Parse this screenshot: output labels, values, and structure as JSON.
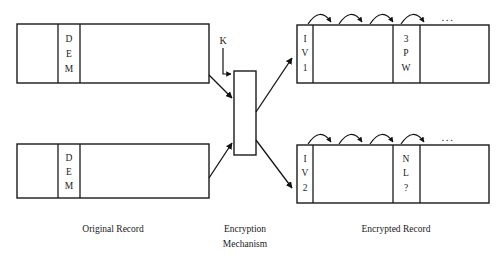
{
  "figure": {
    "background_color": "#ffffff",
    "line_color": "#1a1a1a"
  },
  "captions": {
    "original": "Original Record",
    "encryption_line1": "Encryption",
    "encryption_line2": "Mechanism",
    "encrypted": "Encrypted Record"
  },
  "key": {
    "label": "K"
  },
  "ellipsis": {
    "glyph": "..."
  },
  "original_records": [
    {
      "name": "original-record-top",
      "cells": [
        {
          "label": "",
          "letters": []
        },
        {
          "label": "DEM",
          "letters": [
            "D",
            "E",
            "M"
          ]
        },
        {
          "label": "",
          "letters": []
        }
      ]
    },
    {
      "name": "original-record-bottom",
      "cells": [
        {
          "label": "",
          "letters": []
        },
        {
          "label": "DEM",
          "letters": [
            "D",
            "E",
            "M"
          ]
        },
        {
          "label": "",
          "letters": []
        }
      ]
    }
  ],
  "encrypted_records": [
    {
      "name": "encrypted-record-top",
      "cells": [
        {
          "label": "IV1",
          "letters": [
            "I",
            "V",
            "1"
          ]
        },
        {
          "label": "",
          "letters": []
        },
        {
          "label": "3PW",
          "letters": [
            "3",
            "P",
            "W"
          ]
        },
        {
          "label": "",
          "letters": []
        }
      ],
      "chain_arcs": 4
    },
    {
      "name": "encrypted-record-bottom",
      "cells": [
        {
          "label": "IV2",
          "letters": [
            "I",
            "V",
            "2"
          ]
        },
        {
          "label": "",
          "letters": []
        },
        {
          "label": "NL?",
          "letters": [
            "N",
            "L",
            "?"
          ]
        },
        {
          "label": "",
          "letters": []
        }
      ],
      "chain_arcs": 4
    }
  ],
  "encryption_mechanism": {
    "name": "encryption-mechanism-box",
    "input_arrows": 3,
    "output_arrows": 2
  }
}
